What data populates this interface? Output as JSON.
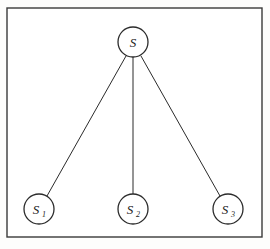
{
  "figure": {
    "kind": "star-topology-graph",
    "background_color": "#fdfdfc",
    "ink_color": "#2b2b2b",
    "frame": {
      "name": "outer-border",
      "x": 7,
      "y": 8,
      "width": 255,
      "height": 229,
      "stroke_color": "#3a3a3a",
      "stroke_width": 1.4,
      "fill": "#ffffff"
    },
    "nodes": [
      {
        "id": "s",
        "label": "S",
        "subscript": "",
        "role": "root",
        "cx": 133,
        "cy": 42,
        "r": 15,
        "stroke_color": "#2b2b2b",
        "stroke_width": 1.3,
        "fill": "#ffffff"
      },
      {
        "id": "s1",
        "label": "S",
        "subscript": "1",
        "role": "leaf",
        "cx": 39,
        "cy": 209,
        "r": 15,
        "stroke_color": "#2b2b2b",
        "stroke_width": 1.3,
        "fill": "#ffffff"
      },
      {
        "id": "s2",
        "label": "S",
        "subscript": "2",
        "role": "leaf",
        "cx": 133,
        "cy": 209,
        "r": 15,
        "stroke_color": "#2b2b2b",
        "stroke_width": 1.3,
        "fill": "#ffffff"
      },
      {
        "id": "s3",
        "label": "S",
        "subscript": "3",
        "role": "leaf",
        "cx": 228,
        "cy": 209,
        "r": 15,
        "stroke_color": "#2b2b2b",
        "stroke_width": 1.3,
        "fill": "#ffffff"
      }
    ],
    "edges": [
      {
        "id": "edge-s-s1",
        "from": "s",
        "to": "s1",
        "x1": 126,
        "y1": 56,
        "x2": 47,
        "y2": 196,
        "stroke_color": "#2b2b2b",
        "stroke_width": 1
      },
      {
        "id": "edge-s-s2",
        "from": "s",
        "to": "s2",
        "x1": 133,
        "y1": 57,
        "x2": 133,
        "y2": 194,
        "stroke_color": "#2b2b2b",
        "stroke_width": 1
      },
      {
        "id": "edge-s-s3",
        "from": "s",
        "to": "s3",
        "x1": 141,
        "y1": 56,
        "x2": 220,
        "y2": 196,
        "stroke_color": "#2b2b2b",
        "stroke_width": 1
      }
    ]
  }
}
